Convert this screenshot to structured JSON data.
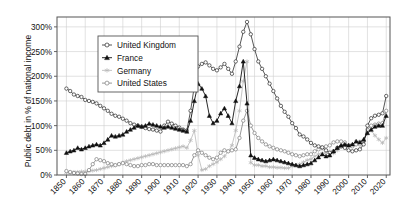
{
  "chart_data": {
    "type": "line",
    "title": "",
    "xlabel": "",
    "ylabel": "Public debt in % of national income",
    "xlim": [
      1845,
      2022
    ],
    "ylim": [
      0,
      320
    ],
    "grid": true,
    "legend_position": "top-left-inside",
    "x_ticks": [
      1850,
      1860,
      1870,
      1880,
      1890,
      1900,
      1910,
      1920,
      1930,
      1940,
      1950,
      1960,
      1970,
      1980,
      1990,
      2000,
      2010,
      2020
    ],
    "x_tick_labels": [
      "1850",
      "1860",
      "1870",
      "1880",
      "1890",
      "1900",
      "1910",
      "1920",
      "1930",
      "1940",
      "1950",
      "1960",
      "1970",
      "1980",
      "1990",
      "2000",
      "2010",
      "2020"
    ],
    "y_ticks": [
      0,
      50,
      100,
      150,
      200,
      250,
      300
    ],
    "y_tick_labels": [
      "0%",
      "50%",
      "100%",
      "150%",
      "200%",
      "250%",
      "300%"
    ],
    "series": [
      {
        "name": "United Kingdom",
        "marker": "open-circle",
        "color": "#2b2b2b",
        "x": [
          1850,
          1852,
          1854,
          1856,
          1858,
          1860,
          1862,
          1864,
          1866,
          1868,
          1870,
          1872,
          1874,
          1876,
          1878,
          1880,
          1882,
          1884,
          1886,
          1888,
          1890,
          1892,
          1894,
          1896,
          1898,
          1900,
          1902,
          1904,
          1906,
          1908,
          1910,
          1912,
          1914,
          1916,
          1918,
          1920,
          1922,
          1924,
          1926,
          1928,
          1930,
          1932,
          1934,
          1936,
          1938,
          1940,
          1942,
          1944,
          1946,
          1948,
          1950,
          1952,
          1954,
          1956,
          1958,
          1960,
          1962,
          1964,
          1966,
          1968,
          1970,
          1972,
          1974,
          1976,
          1978,
          1980,
          1982,
          1984,
          1986,
          1988,
          1990,
          1992,
          1994,
          1996,
          1998,
          2000,
          2002,
          2004,
          2006,
          2008,
          2010,
          2012,
          2014,
          2016,
          2018,
          2020
        ],
        "y": [
          175,
          170,
          163,
          160,
          158,
          152,
          150,
          148,
          145,
          140,
          135,
          130,
          124,
          120,
          118,
          114,
          110,
          105,
          102,
          100,
          98,
          95,
          93,
          92,
          90,
          88,
          100,
          108,
          104,
          100,
          96,
          92,
          90,
          130,
          180,
          220,
          225,
          228,
          222,
          215,
          212,
          218,
          225,
          215,
          205,
          230,
          260,
          290,
          310,
          285,
          255,
          230,
          215,
          200,
          185,
          170,
          155,
          140,
          128,
          118,
          105,
          95,
          82,
          78,
          72,
          65,
          60,
          58,
          56,
          50,
          45,
          48,
          55,
          58,
          55,
          50,
          48,
          50,
          52,
          62,
          100,
          115,
          120,
          122,
          125,
          160
        ]
      },
      {
        "name": "France",
        "marker": "filled-triangle",
        "color": "#111111",
        "x": [
          1850,
          1852,
          1854,
          1856,
          1858,
          1860,
          1862,
          1864,
          1866,
          1868,
          1870,
          1872,
          1874,
          1876,
          1878,
          1880,
          1882,
          1884,
          1886,
          1888,
          1890,
          1892,
          1894,
          1896,
          1898,
          1900,
          1902,
          1904,
          1906,
          1908,
          1910,
          1912,
          1914,
          1916,
          1918,
          1920,
          1922,
          1924,
          1926,
          1928,
          1930,
          1932,
          1934,
          1936,
          1938,
          1940,
          1942,
          1944,
          1946,
          1948,
          1950,
          1952,
          1954,
          1956,
          1958,
          1960,
          1962,
          1964,
          1966,
          1968,
          1970,
          1972,
          1974,
          1976,
          1978,
          1980,
          1982,
          1984,
          1986,
          1988,
          1990,
          1992,
          1994,
          1996,
          1998,
          2000,
          2002,
          2004,
          2006,
          2008,
          2010,
          2012,
          2014,
          2016,
          2018,
          2020
        ],
        "y": [
          45,
          48,
          50,
          55,
          52,
          55,
          58,
          60,
          62,
          60,
          65,
          72,
          80,
          78,
          80,
          82,
          88,
          92,
          96,
          100,
          98,
          100,
          104,
          102,
          100,
          98,
          96,
          98,
          96,
          94,
          92,
          90,
          88,
          110,
          150,
          185,
          175,
          160,
          120,
          105,
          110,
          125,
          135,
          120,
          105,
          150,
          180,
          230,
          145,
          40,
          35,
          32,
          30,
          28,
          30,
          32,
          30,
          28,
          26,
          24,
          22,
          20,
          18,
          20,
          22,
          24,
          30,
          36,
          42,
          38,
          40,
          48,
          55,
          60,
          62,
          60,
          62,
          68,
          66,
          72,
          85,
          92,
          98,
          100,
          100,
          120
        ]
      },
      {
        "name": "Germany",
        "marker": "light-star",
        "color": "#b8b8b8",
        "x": [
          1850,
          1852,
          1854,
          1856,
          1858,
          1860,
          1862,
          1864,
          1866,
          1868,
          1870,
          1872,
          1874,
          1876,
          1878,
          1880,
          1882,
          1884,
          1886,
          1888,
          1890,
          1892,
          1894,
          1896,
          1898,
          1900,
          1902,
          1904,
          1906,
          1908,
          1910,
          1912,
          1914,
          1916,
          1918,
          1920,
          1922,
          1924,
          1926,
          1928,
          1930,
          1932,
          1934,
          1936,
          1938,
          1940,
          1942,
          1944,
          1946,
          1948,
          1950,
          1952,
          1954,
          1956,
          1958,
          1960,
          1962,
          1964,
          1966,
          1968,
          1970,
          1972,
          1974,
          1976,
          1978,
          1980,
          1982,
          1984,
          1986,
          1988,
          1990,
          1992,
          1994,
          1996,
          1998,
          2000,
          2002,
          2004,
          2006,
          2008,
          2010,
          2012,
          2014,
          2016,
          2018,
          2020
        ],
        "y": [
          5,
          5,
          6,
          6,
          7,
          7,
          8,
          9,
          10,
          12,
          14,
          16,
          18,
          20,
          22,
          25,
          28,
          30,
          32,
          34,
          36,
          38,
          40,
          42,
          44,
          46,
          48,
          50,
          52,
          54,
          56,
          58,
          55,
          70,
          90,
          40,
          10,
          12,
          18,
          22,
          26,
          32,
          38,
          48,
          60,
          90,
          130,
          190,
          230,
          25,
          20,
          20,
          18,
          18,
          16,
          16,
          15,
          15,
          14,
          14,
          18,
          20,
          22,
          26,
          30,
          32,
          38,
          42,
          44,
          45,
          42,
          44,
          50,
          58,
          62,
          60,
          62,
          68,
          68,
          70,
          85,
          90,
          80,
          72,
          65,
          75
        ]
      },
      {
        "name": "United States",
        "marker": "open-circle-gray",
        "color": "#7d7d7d",
        "x": [
          1850,
          1852,
          1854,
          1856,
          1858,
          1860,
          1862,
          1864,
          1866,
          1868,
          1870,
          1872,
          1874,
          1876,
          1878,
          1880,
          1882,
          1884,
          1886,
          1888,
          1890,
          1892,
          1894,
          1896,
          1898,
          1900,
          1902,
          1904,
          1906,
          1908,
          1910,
          1912,
          1914,
          1916,
          1918,
          1920,
          1922,
          1924,
          1926,
          1928,
          1930,
          1932,
          1934,
          1936,
          1938,
          1940,
          1942,
          1944,
          1946,
          1948,
          1950,
          1952,
          1954,
          1956,
          1958,
          1960,
          1962,
          1964,
          1966,
          1968,
          1970,
          1972,
          1974,
          1976,
          1978,
          1980,
          1982,
          1984,
          1986,
          1988,
          1990,
          1992,
          1994,
          1996,
          1998,
          2000,
          2002,
          2004,
          2006,
          2008,
          2010,
          2012,
          2014,
          2016,
          2018,
          2020
        ],
        "y": [
          8,
          6,
          4,
          3,
          2,
          2,
          10,
          22,
          32,
          30,
          28,
          24,
          22,
          20,
          22,
          24,
          22,
          20,
          18,
          18,
          20,
          20,
          22,
          22,
          20,
          20,
          20,
          20,
          20,
          20,
          20,
          20,
          18,
          22,
          40,
          50,
          45,
          40,
          35,
          32,
          35,
          45,
          50,
          48,
          50,
          52,
          75,
          110,
          130,
          100,
          85,
          75,
          68,
          62,
          58,
          55,
          52,
          50,
          48,
          45,
          42,
          40,
          38,
          40,
          42,
          42,
          48,
          52,
          55,
          58,
          60,
          66,
          68,
          68,
          66,
          60,
          58,
          62,
          62,
          68,
          92,
          100,
          102,
          104,
          105,
          130
        ]
      }
    ]
  }
}
